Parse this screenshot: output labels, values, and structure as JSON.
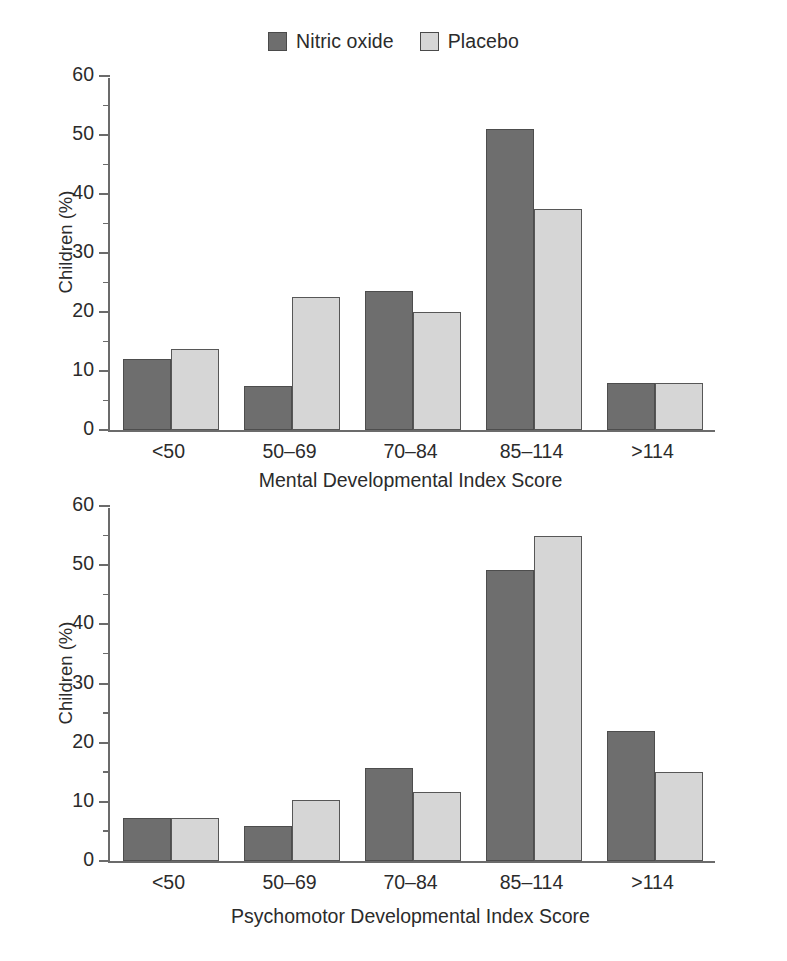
{
  "legend": {
    "items": [
      {
        "label": "Nitric oxide",
        "color": "#6e6e6e",
        "icon": "legend-swatch-dark"
      },
      {
        "label": "Placebo",
        "color": "#d6d6d6",
        "icon": "legend-swatch-light"
      }
    ]
  },
  "chart_data": [
    {
      "type": "bar",
      "title": "",
      "xlabel": "Mental Developmental Index Score",
      "ylabel": "Children (%)",
      "categories": [
        "<50",
        "50–69",
        "70–84",
        "85–114",
        ">114"
      ],
      "series": [
        {
          "name": "Nitric oxide",
          "color": "#6e6e6e",
          "values": [
            12.0,
            7.5,
            23.5,
            51.0,
            8.0
          ]
        },
        {
          "name": "Placebo",
          "color": "#d6d6d6",
          "values": [
            13.8,
            22.5,
            20.0,
            37.5,
            8.0
          ]
        }
      ],
      "ylim": [
        0,
        60
      ],
      "yticks": [
        0,
        10,
        20,
        30,
        40,
        50,
        60
      ],
      "yticks_minor": [
        5,
        15,
        25,
        35,
        45,
        55
      ],
      "ytick_labels": [
        "0",
        "10",
        "20",
        "30",
        "40",
        "50",
        "60"
      ],
      "grid": false,
      "legend_position": "top-center"
    },
    {
      "type": "bar",
      "title": "",
      "xlabel": "Psychomotor Developmental Index Score",
      "ylabel": "Children (%)",
      "categories": [
        "<50",
        "50–69",
        "70–84",
        "85–114",
        ">114"
      ],
      "series": [
        {
          "name": "Nitric oxide",
          "color": "#6e6e6e",
          "values": [
            7.2,
            6.0,
            15.8,
            49.2,
            22.0
          ]
        },
        {
          "name": "Placebo",
          "color": "#d6d6d6",
          "values": [
            7.2,
            10.3,
            11.6,
            55.0,
            15.1
          ]
        }
      ],
      "ylim": [
        0,
        60
      ],
      "yticks": [
        0,
        10,
        20,
        30,
        40,
        50,
        60
      ],
      "yticks_minor": [
        5,
        15,
        25,
        35,
        45,
        55
      ],
      "ytick_labels": [
        "0",
        "10",
        "20",
        "30",
        "40",
        "50",
        "60"
      ],
      "grid": false,
      "legend_position": "top-center"
    }
  ]
}
